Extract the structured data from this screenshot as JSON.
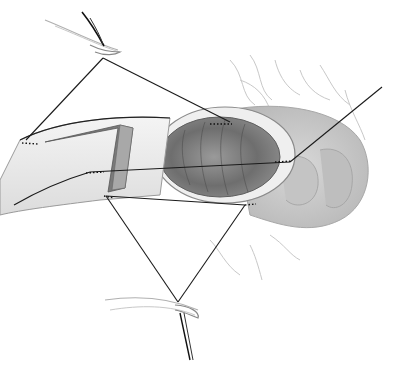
{
  "diagram": {
    "type": "surgical-illustration",
    "labels": [],
    "colors": {
      "background": "#ffffff",
      "line": "#1a1a1a",
      "tissue_light": "#e6e6e6",
      "tissue_mid": "#b5b5b5",
      "tissue_dark": "#6f6f6f"
    },
    "elements": [
      {
        "name": "upper-needle-holder",
        "description": "curved needle/forceps at top"
      },
      {
        "name": "lower-needle-holder",
        "description": "curved needle/forceps at bottom"
      },
      {
        "name": "bowel-end-open",
        "description": "open bowel lumen"
      },
      {
        "name": "bowel-stump-cut",
        "description": "cut bowel segment on the left"
      },
      {
        "name": "mesentery",
        "description": "vascular mesenteric tissue"
      },
      {
        "name": "stay-sutures",
        "description": "suture lines connecting points"
      }
    ]
  }
}
